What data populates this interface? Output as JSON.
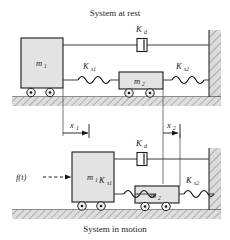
{
  "figure": {
    "title_top": "System at rest",
    "title_bottom": "System in motion"
  },
  "colors": {
    "mass_fill": "#e3e3e3",
    "mass_stroke": "#1a1a1a",
    "hatch": "#8a8a8a",
    "ground_fill": "#d8d8d8",
    "line": "#3c3c3c",
    "text": "#262626"
  },
  "top_diagram": {
    "caption": "System at rest",
    "mass1_label": "m",
    "mass1_sub": "1",
    "mass2_label": "m",
    "mass2_sub": "2",
    "damper_label": "K",
    "damper_sub": "d",
    "spring1_label": "K",
    "spring1_sub": "s1",
    "spring2_label": "K",
    "spring2_sub": "s2"
  },
  "bottom_diagram": {
    "caption": "System in motion",
    "mass1_label": "m",
    "mass1_sub": "1",
    "mass2_label": "m",
    "mass2_sub": "2",
    "damper_label": "K",
    "damper_sub": "d",
    "spring1_label": "K",
    "spring1_sub": "s1",
    "spring2_label": "K",
    "spring2_sub": "s2",
    "force_label": "f(t)",
    "disp1_label": "x",
    "disp1_sub": "1",
    "disp2_label": "x",
    "disp2_sub": "2"
  }
}
